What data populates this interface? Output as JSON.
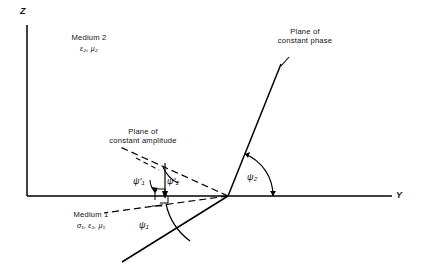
{
  "figure": {
    "background_color": "#ffffff",
    "line_color": "#000000",
    "axes": {
      "vertical_label": "Z",
      "horizontal_label": "Y",
      "origin_px": [
        27,
        196
      ],
      "vertical_top_px": [
        27,
        25
      ],
      "horizontal_right_px": [
        392,
        196
      ]
    },
    "media": {
      "upper": {
        "name": "Medium 2",
        "params": "ε₂, μ₂"
      },
      "lower": {
        "name": "Medium 1",
        "params": "σ₁, ε₁, μ₁"
      }
    },
    "planes": {
      "phase": {
        "line1": "Plane of",
        "line2": "constant phase"
      },
      "amplitude": {
        "line1": "Plane of",
        "line2": "constant amplitude"
      }
    },
    "angles": [
      {
        "id": "psi1",
        "symbol": "ψ",
        "subscript": "1",
        "prime": false,
        "label": "ψ₁",
        "region": "medium-1-incident"
      },
      {
        "id": "psi2",
        "symbol": "ψ",
        "subscript": "2",
        "prime": false,
        "label": "ψ₂",
        "region": "medium-2-transmitted"
      },
      {
        "id": "psi1prime",
        "symbol": "ψ",
        "subscript": "1",
        "prime": true,
        "label": "ψ'₁",
        "region": "amplitude-plane-left"
      },
      {
        "id": "psi2prime",
        "symbol": "ψ",
        "subscript": "2",
        "prime": true,
        "label": "ψ'₂",
        "region": "amplitude-plane-right"
      }
    ],
    "geometry": {
      "convergence_point_px": [
        228,
        196
      ],
      "phase_line_upper_px": [
        281,
        64
      ],
      "phase_line_lower_px": [
        122,
        262
      ],
      "amplitude_dash_upper_px": [
        118,
        146
      ],
      "amplitude_dash_lower_px": [
        105,
        213
      ]
    }
  }
}
